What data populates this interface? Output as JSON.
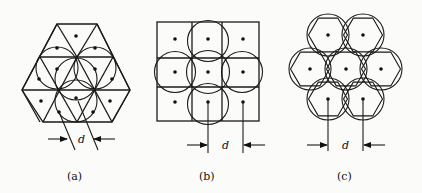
{
  "figure": {
    "panels": [
      {
        "id": "a",
        "label": "(a)",
        "dimension_label": "d",
        "description": "Hexagonal arrangement subdivided into triangles with inscribed circles and center dots"
      },
      {
        "id": "b",
        "label": "(b)",
        "dimension_label": "d",
        "description": "3x3 square grid with five overlapping circles and center dots"
      },
      {
        "id": "c",
        "label": "(c)",
        "dimension_label": "d",
        "description": "Seven hexagons each circumscribed by a circle in a hexagonal close-packed arrangement with center dots"
      }
    ]
  },
  "colors": {
    "line": "#1a1a1a",
    "background": "#fbfbfa"
  }
}
